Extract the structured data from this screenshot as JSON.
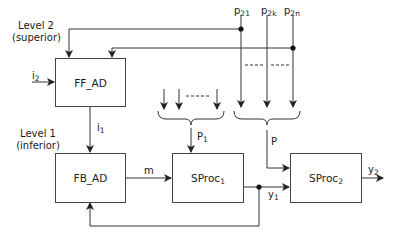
{
  "levels": {
    "level2": {
      "title": "Level 2",
      "subtitle": "(superior)"
    },
    "level1": {
      "title": "Level 1",
      "subtitle": "(inferior)"
    }
  },
  "blocks": {
    "ff_ad": {
      "label": "FF_AD"
    },
    "fb_ad": {
      "label": "FB_AD"
    },
    "sproc1": {
      "label": "SProc",
      "sub": "1"
    },
    "sproc2": {
      "label": "SProc",
      "sub": "2"
    }
  },
  "signals": {
    "i2": {
      "label": "i",
      "sub": "2"
    },
    "i1": {
      "label": "i",
      "sub": "1"
    },
    "m": {
      "label": "m"
    },
    "p1": {
      "label": "P",
      "sub": "1"
    },
    "p": {
      "label": "P"
    },
    "y1": {
      "label": "y",
      "sub": "1"
    },
    "y2": {
      "label": "y",
      "sub": "2"
    },
    "p21": {
      "label": "p",
      "sub": "21"
    },
    "p2k": {
      "label": "p",
      "sub": "2k"
    },
    "p2n": {
      "label": "p",
      "sub": "2n"
    }
  },
  "colors": {
    "line": "#333333",
    "background": "#ffffff"
  }
}
